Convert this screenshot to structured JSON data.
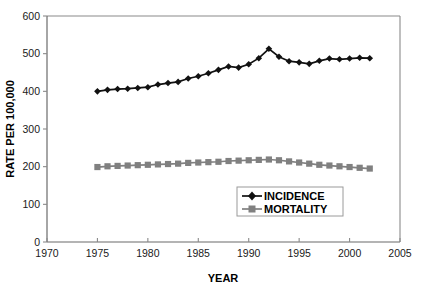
{
  "figure": {
    "cropped_caption_fragment": "                                                                                                                              ",
    "axis_title_x": "YEAR",
    "axis_title_y": "RATE PER 100,000"
  },
  "legend": {
    "position": "inside-bottom-center",
    "entries": [
      {
        "label": "INCIDENCE",
        "marker": "diamond-marker",
        "color": "#111111"
      },
      {
        "label": "MORTALITY",
        "marker": "square-marker",
        "color": "#808080"
      }
    ]
  },
  "chart_data": {
    "type": "line",
    "title": "",
    "subtitle": "",
    "xlabel": "YEAR",
    "ylabel": "RATE PER 100,000",
    "xlim": [
      1970,
      2005
    ],
    "ylim": [
      0,
      600
    ],
    "xticks": [
      1970,
      1975,
      1980,
      1985,
      1990,
      1995,
      2000,
      2005
    ],
    "yticks": [
      0,
      100,
      200,
      300,
      400,
      500,
      600
    ],
    "xtick_labels": [
      "1970",
      "1975",
      "1980",
      "1985",
      "1990",
      "1995",
      "2000",
      "2005"
    ],
    "ytick_labels": [
      "0",
      "100",
      "200",
      "300",
      "400",
      "500",
      "600"
    ],
    "grid": false,
    "legend_position": "inside-bottom-center",
    "x": [
      1975,
      1976,
      1977,
      1978,
      1979,
      1980,
      1981,
      1982,
      1983,
      1984,
      1985,
      1986,
      1987,
      1988,
      1989,
      1990,
      1991,
      1992,
      1993,
      1994,
      1995,
      1996,
      1997,
      1998,
      1999,
      2000,
      2001,
      2002
    ],
    "series": [
      {
        "name": "INCIDENCE",
        "color": "#111111",
        "marker": "diamond",
        "values": [
          400,
          404,
          406,
          407,
          409,
          411,
          418,
          422,
          425,
          434,
          440,
          448,
          457,
          466,
          463,
          472,
          488,
          513,
          492,
          480,
          477,
          473,
          481,
          487,
          485,
          487,
          489,
          488
        ]
      },
      {
        "name": "MORTALITY",
        "color": "#808080",
        "marker": "square",
        "values": [
          199,
          201,
          202,
          203,
          204,
          205,
          206,
          207,
          208,
          210,
          211,
          212,
          213,
          215,
          216,
          217,
          218,
          219,
          217,
          214,
          211,
          208,
          205,
          203,
          201,
          199,
          197,
          195
        ]
      }
    ]
  }
}
